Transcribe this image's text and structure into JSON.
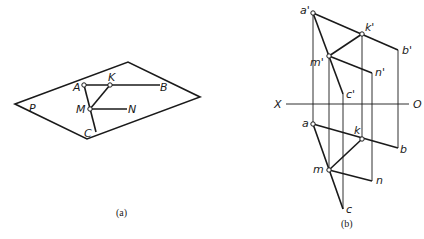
{
  "figure_a": {
    "caption": "(a)",
    "plane_label": "P",
    "points": {
      "A": "A",
      "K": "K",
      "B": "B",
      "M": "M",
      "N": "N",
      "C": "C"
    }
  },
  "figure_b": {
    "caption": "(b)",
    "axis": {
      "left": "X",
      "right": "O"
    },
    "front_view": {
      "a": "a'",
      "k": "k'",
      "b": "b'",
      "m": "m'",
      "n": "n'",
      "c": "c'"
    },
    "top_view": {
      "a": "a",
      "k": "k",
      "b": "b",
      "m": "m",
      "n": "n",
      "c": "c"
    }
  }
}
